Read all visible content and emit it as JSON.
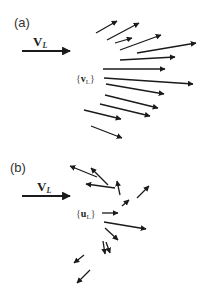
{
  "colors": {
    "background": "#ffffff",
    "arrow": "#1a1a1a",
    "text": "#333333"
  },
  "panels": [
    {
      "id": "a",
      "label": "(a)",
      "label_pos": [
        14,
        27
      ],
      "mean_vector": {
        "symbol": "V",
        "subscript": "L",
        "label_pos": [
          33,
          46
        ],
        "arrow": [
          22,
          51,
          70,
          51
        ]
      },
      "set_label": {
        "open": "{",
        "symbol": "v",
        "subscript": "L",
        "close": "}",
        "pos": [
          76,
          82
        ]
      },
      "arrows": [
        [
          96,
          33,
          117,
          21
        ],
        [
          107,
          40,
          139,
          23
        ],
        [
          115,
          43,
          132,
          38
        ],
        [
          120,
          50,
          161,
          35
        ],
        [
          137,
          53,
          196,
          43
        ],
        [
          120,
          60,
          175,
          57
        ],
        [
          103,
          69,
          165,
          69
        ],
        [
          104,
          78,
          193,
          84
        ],
        [
          106,
          84,
          164,
          94
        ],
        [
          105,
          95,
          158,
          108
        ],
        [
          100,
          104,
          150,
          116
        ],
        [
          84,
          110,
          121,
          119
        ],
        [
          91,
          126,
          122,
          138
        ]
      ]
    },
    {
      "id": "b",
      "label": "(b)",
      "label_pos": [
        10,
        172
      ],
      "mean_vector": {
        "symbol": "V",
        "subscript": "L",
        "label_pos": [
          37,
          191
        ],
        "arrow": [
          22,
          196,
          70,
          196
        ]
      },
      "set_label": {
        "open": "{",
        "symbol": "u",
        "subscript": "L",
        "close": "}",
        "pos": [
          76,
          217
        ]
      },
      "arrows": [
        [
          97,
          177,
          70,
          166
        ],
        [
          108,
          185,
          91,
          168
        ],
        [
          115,
          188,
          86,
          184
        ],
        [
          120,
          195,
          117,
          181
        ],
        [
          137,
          198,
          149,
          186
        ],
        [
          122,
          206,
          129,
          200
        ],
        [
          102,
          213,
          118,
          213
        ],
        [
          104,
          222,
          146,
          229
        ],
        [
          105,
          228,
          118,
          240
        ],
        [
          103,
          241,
          105,
          254
        ],
        [
          106,
          242,
          110,
          253
        ],
        [
          84,
          255,
          74,
          263
        ],
        [
          90,
          270,
          77,
          283
        ]
      ]
    }
  ]
}
